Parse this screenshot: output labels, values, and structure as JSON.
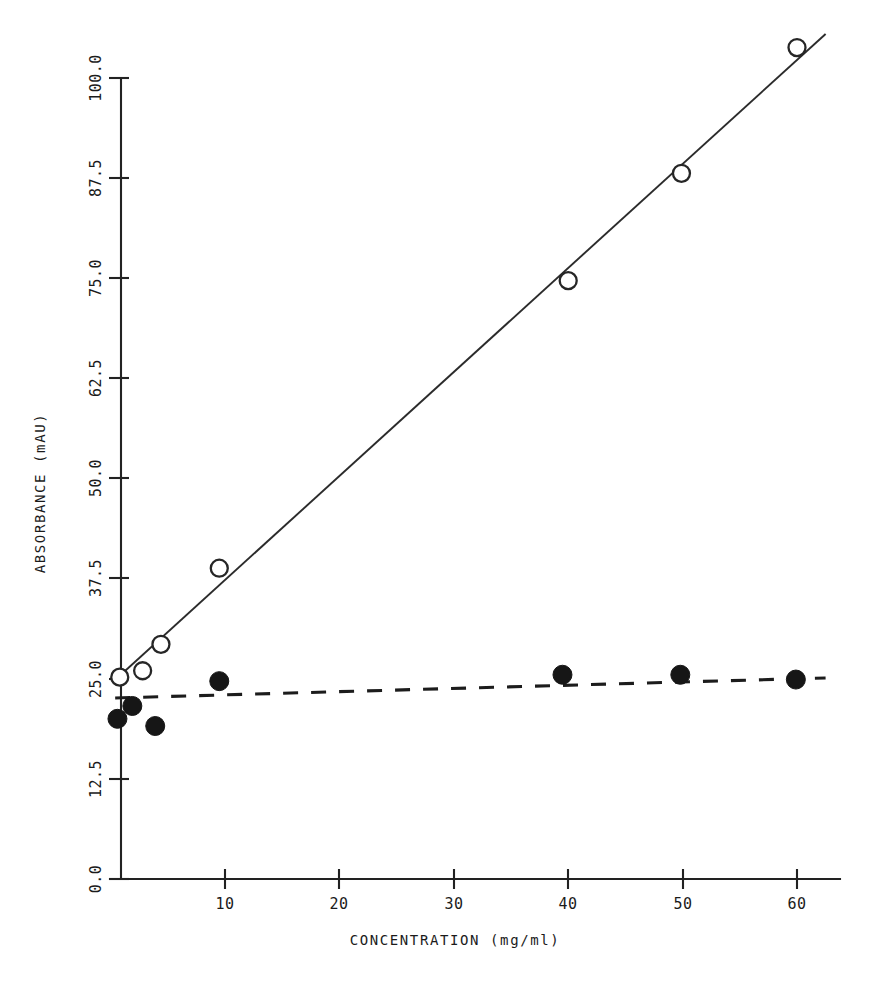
{
  "figure": {
    "background_color": "#ffffff",
    "ink_color": "#1b1b1b",
    "top_partial_text": "graph copy artifact"
  },
  "chart_data": {
    "type": "scatter",
    "title": "",
    "subtitle": "",
    "xlabel": "CONCENTRATION (mg/ml)",
    "ylabel": "ABSORBANCE (mAU)",
    "xlim": [
      0,
      63
    ],
    "ylim": [
      0,
      106
    ],
    "grid": false,
    "legend_position": "none",
    "xticks": [
      10,
      20,
      30,
      40,
      50,
      60
    ],
    "xtick_labels": [
      "10",
      "20",
      "30",
      "40",
      "50",
      "60"
    ],
    "yticks": [
      0.0,
      12.5,
      25.0,
      37.5,
      50.0,
      62.5,
      75.0,
      87.5,
      100.0
    ],
    "ytick_labels": [
      "0.0",
      "12.5",
      "25.0",
      "37.5",
      "50.0",
      "62.5",
      "75.0",
      "87.5",
      "100.0"
    ],
    "series": [
      {
        "name": "open-circle-series",
        "marker": "open-circle",
        "line_style": "solid",
        "x": [
          0.8,
          2.8,
          4.4,
          9.5,
          40.0,
          49.9,
          60.0
        ],
        "y": [
          25.2,
          26.0,
          29.3,
          38.8,
          74.7,
          88.1,
          103.8
        ],
        "fit_line": {
          "x_start": 0.2,
          "y_start": 24.6,
          "x_end": 62.5,
          "y_end": 105.5
        }
      },
      {
        "name": "filled-circle-series",
        "marker": "filled-circle",
        "line_style": "dashed",
        "x": [
          0.6,
          1.9,
          3.9,
          9.5,
          39.5,
          49.8,
          59.9
        ],
        "y": [
          20.0,
          21.6,
          19.1,
          24.7,
          25.5,
          25.5,
          24.9
        ],
        "fit_line": {
          "x_start": 0.4,
          "y_start": 22.6,
          "x_end": 62.5,
          "y_end": 25.1
        }
      }
    ]
  }
}
